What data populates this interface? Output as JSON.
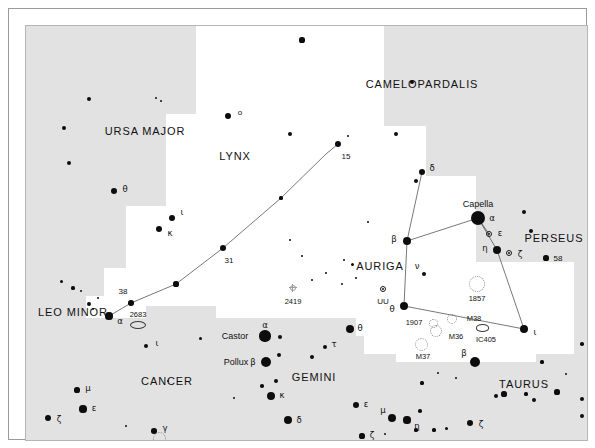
{
  "chart_data": {
    "type": "scatter",
    "subtitle": "",
    "xlabel": "",
    "ylabel": "",
    "grid": false,
    "legend_position": "none",
    "xlim": [
      0,
      561
    ],
    "ylim": [
      0,
      414
    ],
    "background_color": "#e2e2e2",
    "milkyway_color": "#ffffff",
    "star_color": "#0d0d0d",
    "line_color": "#555555",
    "constellation_labels": [
      {
        "text": "CAMELOPARDALIS",
        "x": 396,
        "y": 58
      },
      {
        "text": "URSA MAJOR",
        "x": 119,
        "y": 105
      },
      {
        "text": "LYNX",
        "x": 209,
        "y": 130
      },
      {
        "text": "AURIGA",
        "x": 354,
        "y": 240
      },
      {
        "text": "PERSEUS",
        "x": 528,
        "y": 212
      },
      {
        "text": "LEO MINOR",
        "x": 47,
        "y": 286
      },
      {
        "text": "CANCER",
        "x": 141,
        "y": 355
      },
      {
        "text": "GEMINI",
        "x": 288,
        "y": 351
      },
      {
        "text": "TAURUS",
        "x": 498,
        "y": 358
      }
    ],
    "named_stars": [
      {
        "name": "Capella",
        "x": 452,
        "y": 192,
        "bayer": "α",
        "mag": 0.1
      },
      {
        "name": "Castor",
        "x": 239,
        "y": 310,
        "bayer": "α",
        "mag": 1.6
      },
      {
        "name": "Pollux",
        "x": 240,
        "y": 336,
        "bayer": "β",
        "mag": 1.1
      }
    ],
    "milkyway_regions": [
      {
        "x": 170,
        "y": 0,
        "w": 140,
        "h": 88
      },
      {
        "x": 140,
        "y": 88,
        "w": 200,
        "h": 92
      },
      {
        "x": 100,
        "y": 180,
        "w": 240,
        "h": 62
      },
      {
        "x": 78,
        "y": 242,
        "w": 268,
        "h": 38
      },
      {
        "x": 248,
        "y": 0,
        "w": 110,
        "h": 160
      },
      {
        "x": 300,
        "y": 100,
        "w": 100,
        "h": 120
      },
      {
        "x": 330,
        "y": 150,
        "w": 120,
        "h": 160
      },
      {
        "x": 338,
        "y": 236,
        "w": 210,
        "h": 92
      },
      {
        "x": 190,
        "y": 268,
        "w": 170,
        "h": 24
      },
      {
        "x": 370,
        "y": 300,
        "w": 140,
        "h": 36
      },
      {
        "x": 60,
        "y": 270,
        "w": 60,
        "h": 22
      }
    ],
    "constellation_lines": [
      {
        "name": "lynx-chain",
        "points": [
          [
            83,
            290
          ],
          [
            105,
            277
          ],
          [
            150,
            258
          ],
          [
            197,
            222
          ],
          [
            255,
            172
          ],
          [
            300,
            128
          ],
          [
            312,
            118
          ]
        ]
      },
      {
        "name": "auriga-delta-beta",
        "points": [
          [
            396,
            146
          ],
          [
            381,
            215
          ]
        ]
      },
      {
        "name": "auriga-beta-capella",
        "points": [
          [
            381,
            215
          ],
          [
            452,
            192
          ]
        ]
      },
      {
        "name": "auriga-capella-eta",
        "points": [
          [
            452,
            192
          ],
          [
            471,
            224
          ]
        ]
      },
      {
        "name": "auriga-capella-eps",
        "points": [
          [
            452,
            192
          ],
          [
            463,
            208
          ]
        ]
      },
      {
        "name": "auriga-eta-iota",
        "points": [
          [
            471,
            224
          ],
          [
            498,
            303
          ]
        ]
      },
      {
        "name": "auriga-beta-theta",
        "points": [
          [
            381,
            215
          ],
          [
            378,
            280
          ]
        ]
      },
      {
        "name": "auriga-theta-iota",
        "points": [
          [
            378,
            280
          ],
          [
            498,
            303
          ]
        ]
      }
    ],
    "stars": [
      {
        "x": 202,
        "y": 90,
        "r": 3.4,
        "label": "o",
        "lx": 214,
        "ly": 86
      },
      {
        "x": 38,
        "y": 102,
        "r": 2.0
      },
      {
        "x": 63,
        "y": 73,
        "r": 2.4
      },
      {
        "x": 130,
        "y": 72,
        "r": 1.4
      },
      {
        "x": 135,
        "y": 75,
        "r": 1.2
      },
      {
        "x": 43,
        "y": 137,
        "r": 2.0
      },
      {
        "x": 88,
        "y": 165,
        "r": 3.2,
        "label": "θ",
        "lx": 99,
        "ly": 163
      },
      {
        "x": 146,
        "y": 192,
        "r": 3.0,
        "label": "ι",
        "lx": 156,
        "ly": 186
      },
      {
        "x": 133,
        "y": 203,
        "r": 3.4,
        "label": "κ",
        "lx": 144,
        "ly": 207
      },
      {
        "x": 312,
        "y": 118,
        "r": 3.2,
        "label": "15",
        "lx": 320,
        "ly": 130
      },
      {
        "x": 322,
        "y": 110,
        "r": 1.3
      },
      {
        "x": 255,
        "y": 172,
        "r": 1.6
      },
      {
        "x": 197,
        "y": 222,
        "r": 3.2,
        "label": "31",
        "lx": 203,
        "ly": 234
      },
      {
        "x": 150,
        "y": 258,
        "r": 2.6
      },
      {
        "x": 105,
        "y": 277,
        "r": 2.8,
        "label": "38",
        "lx": 97,
        "ly": 265
      },
      {
        "x": 83,
        "y": 290,
        "r": 3.6,
        "label": "α",
        "lx": 94,
        "ly": 295
      },
      {
        "x": 47,
        "y": 262,
        "r": 1.6
      },
      {
        "x": 55,
        "y": 265,
        "r": 1.2
      },
      {
        "x": 35,
        "y": 255,
        "r": 1.5
      },
      {
        "x": 63,
        "y": 278,
        "r": 1.9
      },
      {
        "x": 67,
        "y": 283,
        "r": 1.4
      },
      {
        "x": 72,
        "y": 272,
        "r": 1.2
      },
      {
        "x": 396,
        "y": 146,
        "r": 3.0,
        "label": "δ",
        "lx": 406,
        "ly": 142
      },
      {
        "x": 381,
        "y": 215,
        "r": 4.4,
        "label": "β",
        "lx": 368,
        "ly": 213
      },
      {
        "x": 452,
        "y": 192,
        "r": 7.0,
        "label": "α",
        "lx": 466,
        "ly": 192
      },
      {
        "x": 471,
        "y": 224,
        "r": 4.0,
        "label": "η",
        "lx": 459,
        "ly": 222
      },
      {
        "x": 378,
        "y": 280,
        "r": 4.0,
        "label": "θ",
        "lx": 366,
        "ly": 283
      },
      {
        "x": 498,
        "y": 303,
        "r": 4.0,
        "label": "ι",
        "lx": 509,
        "ly": 306
      },
      {
        "x": 398,
        "y": 248,
        "r": 2.4,
        "label": "ν",
        "lx": 391,
        "ly": 240
      },
      {
        "x": 316,
        "y": 258,
        "r": 1.4
      },
      {
        "x": 330,
        "y": 252,
        "r": 1.3
      },
      {
        "x": 326,
        "y": 238,
        "r": 1.5
      },
      {
        "x": 318,
        "y": 234,
        "r": 1.2
      },
      {
        "x": 449,
        "y": 336,
        "r": 5.0,
        "label": "β",
        "lx": 438,
        "ly": 327
      },
      {
        "x": 276,
        "y": 14,
        "r": 2.6
      },
      {
        "x": 386,
        "y": 56,
        "r": 2.2
      },
      {
        "x": 264,
        "y": 108,
        "r": 2.4
      },
      {
        "x": 370,
        "y": 108,
        "r": 2.2
      },
      {
        "x": 390,
        "y": 155,
        "r": 2.2
      },
      {
        "x": 498,
        "y": 186,
        "r": 2.0
      },
      {
        "x": 505,
        "y": 205,
        "r": 2.0
      },
      {
        "x": 520,
        "y": 232,
        "r": 2.6,
        "label": "58",
        "lx": 532,
        "ly": 232
      },
      {
        "x": 239,
        "y": 310,
        "r": 5.6
      },
      {
        "x": 254,
        "y": 311,
        "r": 2.2
      },
      {
        "x": 240,
        "y": 336,
        "r": 5.0
      },
      {
        "x": 253,
        "y": 329,
        "r": 2.0
      },
      {
        "x": 250,
        "y": 355,
        "r": 2.0
      },
      {
        "x": 236,
        "y": 360,
        "r": 1.8
      },
      {
        "x": 245,
        "y": 370,
        "r": 4.0,
        "label": "κ",
        "lx": 256,
        "ly": 369
      },
      {
        "x": 286,
        "y": 331,
        "r": 2.4
      },
      {
        "x": 299,
        "y": 321,
        "r": 2.0,
        "label": "τ",
        "lx": 308,
        "ly": 318
      },
      {
        "x": 324,
        "y": 303,
        "r": 4.0,
        "label": "θ",
        "lx": 334,
        "ly": 302
      },
      {
        "x": 262,
        "y": 394,
        "r": 4.0,
        "label": "δ",
        "lx": 273,
        "ly": 394
      },
      {
        "x": 330,
        "y": 379,
        "r": 3.4,
        "label": "ε",
        "lx": 340,
        "ly": 378
      },
      {
        "x": 366,
        "y": 392,
        "r": 4.0,
        "label": "μ",
        "lx": 357,
        "ly": 384
      },
      {
        "x": 381,
        "y": 394,
        "r": 3.6,
        "label": "η",
        "lx": 391,
        "ly": 400
      },
      {
        "x": 336,
        "y": 410,
        "r": 2.6,
        "label": "ζ",
        "lx": 346,
        "ly": 409
      },
      {
        "x": 394,
        "y": 385,
        "r": 1.8
      },
      {
        "x": 390,
        "y": 404,
        "r": 1.6
      },
      {
        "x": 359,
        "y": 408,
        "r": 1.4
      },
      {
        "x": 408,
        "y": 404,
        "r": 1.6
      },
      {
        "x": 420,
        "y": 402,
        "r": 1.5
      },
      {
        "x": 444,
        "y": 397,
        "r": 3.4,
        "label": "ζ",
        "lx": 455,
        "ly": 398
      },
      {
        "x": 142,
        "y": 355,
        "r": 1.2
      },
      {
        "x": 120,
        "y": 320,
        "r": 2.4,
        "label": "ι",
        "lx": 131,
        "ly": 317
      },
      {
        "x": 51,
        "y": 364,
        "r": 2.6,
        "label": "μ",
        "lx": 62,
        "ly": 362
      },
      {
        "x": 22,
        "y": 392,
        "r": 3.0,
        "label": "ζ",
        "lx": 33,
        "ly": 393
      },
      {
        "x": 57,
        "y": 383,
        "r": 3.6,
        "label": "ε",
        "lx": 68,
        "ly": 382
      },
      {
        "x": 100,
        "y": 400,
        "r": 1.4
      },
      {
        "x": 128,
        "y": 405,
        "r": 2.8,
        "label": "γ",
        "lx": 139,
        "ly": 402
      },
      {
        "x": 152,
        "y": 415,
        "r": 1.3
      },
      {
        "x": 470,
        "y": 370,
        "r": 2.0
      },
      {
        "x": 478,
        "y": 368,
        "r": 2.6
      },
      {
        "x": 500,
        "y": 368,
        "r": 1.6
      },
      {
        "x": 508,
        "y": 374,
        "r": 2.4
      },
      {
        "x": 531,
        "y": 366,
        "r": 2.6
      },
      {
        "x": 540,
        "y": 348,
        "r": 1.4
      },
      {
        "x": 516,
        "y": 336,
        "r": 1.6
      },
      {
        "x": 430,
        "y": 352,
        "r": 1.4
      },
      {
        "x": 396,
        "y": 357,
        "r": 1.6
      },
      {
        "x": 412,
        "y": 347,
        "r": 1.2
      },
      {
        "x": 556,
        "y": 390,
        "r": 2.0
      },
      {
        "x": 556,
        "y": 318,
        "r": 1.8
      },
      {
        "x": 556,
        "y": 373,
        "r": 2.2
      },
      {
        "x": 264,
        "y": 214,
        "r": 1.3
      },
      {
        "x": 276,
        "y": 230,
        "r": 1.2
      },
      {
        "x": 300,
        "y": 247,
        "r": 1.3
      },
      {
        "x": 286,
        "y": 254,
        "r": 1.2
      },
      {
        "x": 342,
        "y": 196,
        "r": 1.4
      },
      {
        "x": 174,
        "y": 312,
        "r": 1.5
      },
      {
        "x": 208,
        "y": 372,
        "r": 1.4
      }
    ],
    "variable_stars": [
      {
        "x": 357,
        "y": 263,
        "r": 3.4,
        "label": "UU",
        "lx": 357,
        "ly": 275
      },
      {
        "x": 463,
        "y": 208,
        "r": 3.4,
        "label": "ε",
        "lx": 474,
        "ly": 207
      },
      {
        "x": 483,
        "y": 227,
        "r": 3.4,
        "label": "ζ",
        "lx": 494,
        "ly": 228
      }
    ],
    "globular_clusters": [
      {
        "x": 267,
        "y": 262,
        "r": 3.2,
        "label": "2419",
        "lx": 267,
        "ly": 275
      }
    ],
    "open_clusters": [
      {
        "x": 451,
        "y": 258,
        "r": 8.0,
        "label": "1857",
        "lx": 451,
        "ly": 272
      },
      {
        "x": 426,
        "y": 293,
        "r": 5.0,
        "label": "M38",
        "lx": 448,
        "ly": 292
      },
      {
        "x": 410,
        "y": 305,
        "r": 6.0,
        "label": "M36",
        "lx": 430,
        "ly": 310
      },
      {
        "x": 395,
        "y": 318,
        "r": 6.5,
        "label": "M37",
        "lx": 397,
        "ly": 330
      },
      {
        "x": 407,
        "y": 297,
        "r": 4.5,
        "label": "1907",
        "lx": 388,
        "ly": 296
      },
      {
        "x": 133,
        "y": 412,
        "r": 6.5,
        "label": "",
        "lx": 0,
        "ly": 0
      }
    ],
    "nebulae": [
      {
        "x": 456,
        "y": 302,
        "rx": 6.5,
        "ry": 3.6,
        "label": "IC405",
        "lx": 460,
        "ly": 313
      },
      {
        "x": 112,
        "y": 299,
        "rx": 8.0,
        "ry": 4.0,
        "label": "2683",
        "lx": 112,
        "ly": 288
      }
    ]
  }
}
